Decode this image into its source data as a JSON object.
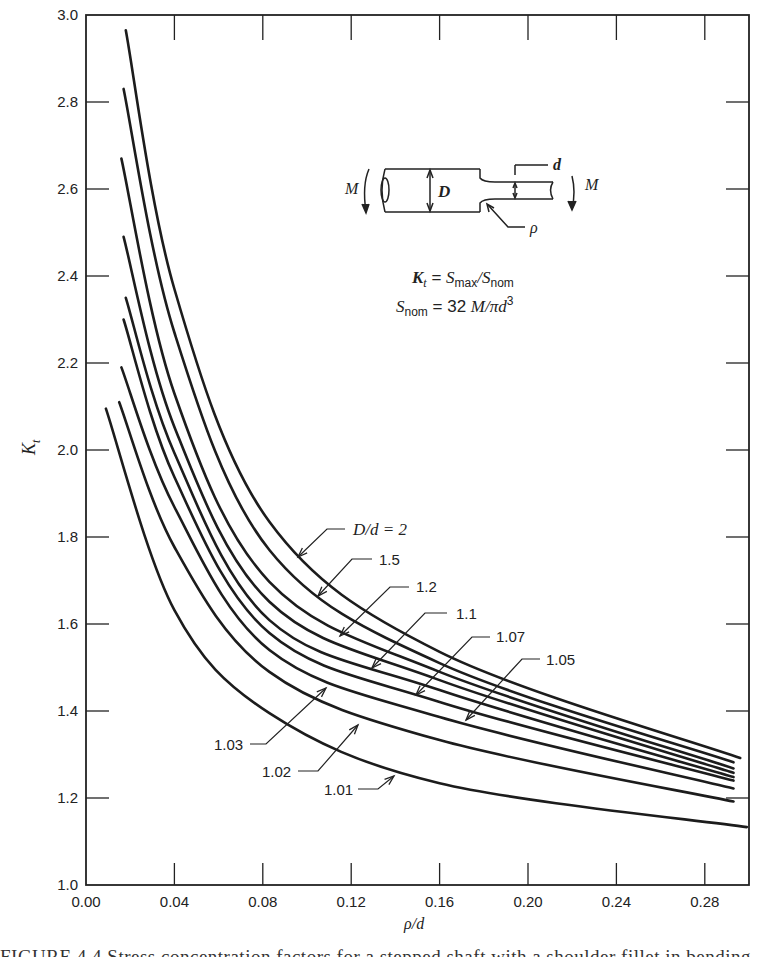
{
  "chart_data": {
    "type": "line",
    "title": "",
    "xlabel": "ρ/d",
    "ylabel": "K_t",
    "xlim": [
      0.0,
      0.3
    ],
    "ylim": [
      1.0,
      3.0
    ],
    "x_ticks": [
      "0.00",
      "0.04",
      "0.08",
      "0.12",
      "0.16",
      "0.20",
      "0.24",
      "0.28"
    ],
    "x_tick_values": [
      0.0,
      0.04,
      0.08,
      0.12,
      0.16,
      0.2,
      0.24,
      0.28
    ],
    "y_ticks": [
      "1.0",
      "1.2",
      "1.4",
      "1.6",
      "1.8",
      "2.0",
      "2.2",
      "2.4",
      "2.6",
      "2.8",
      "3.0"
    ],
    "y_tick_values": [
      1.0,
      1.2,
      1.4,
      1.6,
      1.8,
      2.0,
      2.2,
      2.4,
      2.6,
      2.8,
      3.0
    ],
    "grid": false,
    "legend": "inline leader labels",
    "series": [
      {
        "name": "D/d = 2",
        "x": [
          0.018,
          0.04,
          0.083,
          0.16,
          0.296
        ],
        "values": [
          2.965,
          2.37,
          1.835,
          1.536,
          1.292
        ]
      },
      {
        "name": "1.5",
        "x": [
          0.017,
          0.04,
          0.083,
          0.16,
          0.293
        ],
        "values": [
          2.83,
          2.27,
          1.77,
          1.51,
          1.282
        ]
      },
      {
        "name": "1.2",
        "x": [
          0.016,
          0.04,
          0.083,
          0.16,
          0.293
        ],
        "values": [
          2.67,
          2.13,
          1.697,
          1.49,
          1.268
        ]
      },
      {
        "name": "1.1",
        "x": [
          0.017,
          0.04,
          0.083,
          0.16,
          0.293
        ],
        "values": [
          2.49,
          2.053,
          1.651,
          1.471,
          1.258
        ]
      },
      {
        "name": "1.07",
        "x": [
          0.018,
          0.04,
          0.083,
          0.16,
          0.293
        ],
        "values": [
          2.35,
          1.993,
          1.609,
          1.448,
          1.248
        ]
      },
      {
        "name": "1.05",
        "x": [
          0.017,
          0.04,
          0.083,
          0.16,
          0.293
        ],
        "values": [
          2.3,
          1.938,
          1.579,
          1.421,
          1.24
        ]
      },
      {
        "name": "1.03",
        "x": [
          0.016,
          0.04,
          0.083,
          0.16,
          0.293
        ],
        "values": [
          2.19,
          1.869,
          1.54,
          1.386,
          1.222
        ]
      },
      {
        "name": "1.02",
        "x": [
          0.015,
          0.04,
          0.083,
          0.16,
          0.293
        ],
        "values": [
          2.11,
          1.777,
          1.49,
          1.333,
          1.192
        ]
      },
      {
        "name": "1.01",
        "x": [
          0.009,
          0.04,
          0.083,
          0.16,
          0.299
        ],
        "values": [
          2.095,
          1.632,
          1.395,
          1.234,
          1.133
        ]
      }
    ],
    "annotations": [
      {
        "text": "D/d = 2",
        "series": "D/d = 2",
        "text_px": [
          353,
          535
        ],
        "leader": [
          [
            345,
            529
          ],
          [
            327,
            529
          ],
          [
            298,
            557
          ]
        ]
      },
      {
        "text": "1.5",
        "series": "1.5",
        "text_px": [
          379,
          565
        ],
        "leader": [
          [
            372,
            559
          ],
          [
            352,
            559
          ],
          [
            318,
            596
          ]
        ]
      },
      {
        "text": "1.2",
        "series": "1.2",
        "text_px": [
          416,
          592
        ],
        "leader": [
          [
            409,
            587
          ],
          [
            390,
            587
          ],
          [
            340,
            636
          ]
        ]
      },
      {
        "text": "1.1",
        "series": "1.1",
        "text_px": [
          456,
          619
        ],
        "leader": [
          [
            447,
            613
          ],
          [
            425,
            613
          ],
          [
            372,
            668
          ]
        ]
      },
      {
        "text": "1.07",
        "series": "1.07",
        "text_px": [
          496,
          642
        ],
        "leader": [
          [
            490,
            637
          ],
          [
            472,
            637
          ],
          [
            416,
            695
          ]
        ]
      },
      {
        "text": "1.05",
        "series": "1.05",
        "text_px": [
          546,
          665
        ],
        "leader": [
          [
            540,
            659
          ],
          [
            522,
            659
          ],
          [
            466,
            720
          ]
        ]
      },
      {
        "text": "1.03",
        "series": "1.03",
        "text_px": [
          214,
          750
        ],
        "leader": [
          [
            250,
            744
          ],
          [
            266,
            744
          ],
          [
            326,
            688
          ]
        ]
      },
      {
        "text": "1.02",
        "series": "1.02",
        "text_px": [
          262,
          777
        ],
        "leader": [
          [
            298,
            771
          ],
          [
            318,
            771
          ],
          [
            358,
            725
          ]
        ]
      },
      {
        "text": "1.01",
        "series": "1.01",
        "text_px": [
          324,
          795
        ],
        "leader": [
          [
            358,
            789
          ],
          [
            378,
            789
          ],
          [
            394,
            776
          ]
        ]
      }
    ],
    "formulas": {
      "kt": [
        "K",
        "t",
        " = ",
        "S",
        "max",
        "/",
        "S",
        "nom"
      ],
      "snom": [
        "S",
        "nom",
        " = ",
        "32 ",
        "M/πd",
        "3"
      ]
    },
    "inset": {
      "moment_left": "M",
      "moment_right": "M",
      "large_diameter": "D",
      "small_diameter": "d",
      "fillet_radius": "ρ"
    }
  },
  "caption": "FIGURE 4.4  Stress concentration factors for a stepped shaft with a shoulder fillet in bending"
}
